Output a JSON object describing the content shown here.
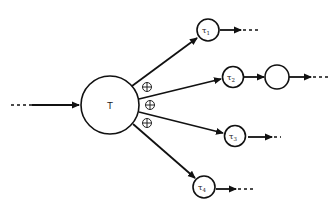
{
  "diagram": {
    "central_node": {
      "label": "T"
    },
    "child_nodes": [
      {
        "label": "τ",
        "sub": "1"
      },
      {
        "label": "τ",
        "sub": "2"
      },
      {
        "label": "τ",
        "sub": "3"
      },
      {
        "label": "τ",
        "sub": "4"
      }
    ],
    "extra_node": {
      "label": ""
    },
    "operators": [
      "⊕",
      "⊕",
      "⊕"
    ],
    "colors": {
      "stroke": "#111111",
      "background": "#ffffff"
    }
  }
}
